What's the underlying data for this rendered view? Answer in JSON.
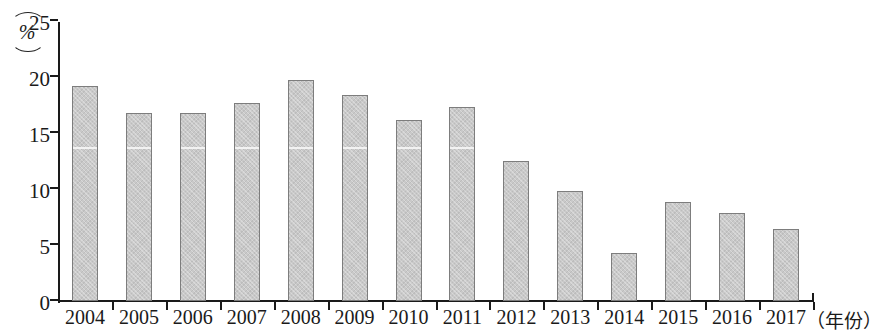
{
  "chart_data": {
    "type": "bar",
    "title": "",
    "subtitle": "",
    "unit_label": "%",
    "xlabel": "（年份）",
    "ylabel": "",
    "ylim": [
      0,
      25
    ],
    "ytick_values": [
      0,
      5,
      10,
      15,
      20,
      25
    ],
    "ytick_labels": [
      "0",
      "5",
      "10",
      "15",
      "20",
      "25"
    ],
    "grid": false,
    "legend": null,
    "categories": [
      "2004",
      "2005",
      "2006",
      "2007",
      "2008",
      "2009",
      "2010",
      "2011",
      "2012",
      "2013",
      "2014",
      "2015",
      "2016",
      "2017"
    ],
    "values": [
      19.2,
      16.8,
      16.8,
      17.7,
      19.7,
      18.4,
      16.2,
      17.3,
      12.5,
      9.8,
      4.3,
      8.8,
      7.9,
      6.4
    ],
    "bar_seam_value": 13.5,
    "colors": {
      "bar_fill": "#c9c9c9",
      "bar_border": "#7d7d7d",
      "axis": "#1a1a1a",
      "text": "#1a1a1a",
      "background": "#ffffff",
      "seam": "#f2f2f2"
    }
  }
}
